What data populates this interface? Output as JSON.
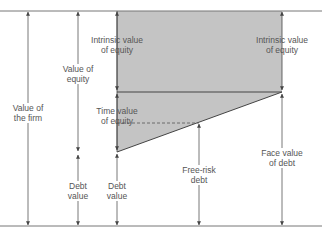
{
  "colors": {
    "shade": "#c4c4c4",
    "line": "#555555",
    "text": "#555555",
    "background": "#ffffff"
  },
  "labels": {
    "value_of_firm": [
      "Value of",
      "the firm"
    ],
    "value_of_equity": [
      "Value of",
      "equity"
    ],
    "intrinsic_value_left": [
      "Intrinsic value",
      "of equity"
    ],
    "intrinsic_value_right": [
      "Intrinsic value",
      "of equity"
    ],
    "time_value": [
      "Time value",
      "of equity"
    ],
    "debt_value_left": [
      "Debt",
      "value"
    ],
    "debt_value_mid": [
      "Debt",
      "value"
    ],
    "free_risk_debt": [
      "Free-risk",
      "debt"
    ],
    "face_value_debt": [
      "Face value",
      "of debt"
    ]
  }
}
